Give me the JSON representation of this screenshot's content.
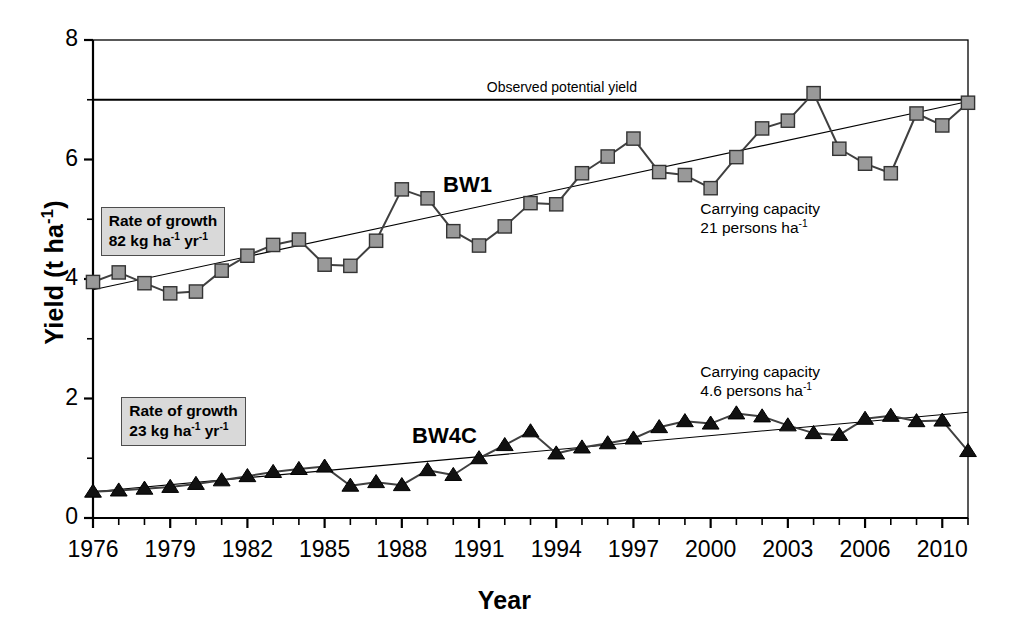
{
  "chart_data": {
    "type": "line",
    "title": "",
    "xlabel": "Year",
    "ylabel": "Yield (t ha-1)",
    "ylabel_base": "Yield (t ha",
    "ylabel_exp": "-1",
    "ylabel_tail": ")",
    "xlim": [
      1976,
      2010
    ],
    "ylim": [
      0,
      8
    ],
    "ytick_values": [
      0,
      2,
      4,
      6,
      8
    ],
    "ytick_labels": [
      "0",
      "2",
      "4",
      "6",
      "8"
    ],
    "yminor_values": [
      1,
      3,
      5,
      7
    ],
    "xtick_values": [
      1976,
      1977,
      1978,
      1979,
      1980,
      1981,
      1982,
      1983,
      1984,
      1985,
      1986,
      1987,
      1988,
      1989,
      1990,
      1991,
      1992,
      1993,
      1994,
      1995,
      1996,
      1997,
      1998,
      1999,
      2000,
      2001,
      2002,
      2003,
      2004,
      2005,
      2006,
      2007,
      2008,
      2009,
      2010
    ],
    "xtick_labels": [
      "1976",
      "1979",
      "1982",
      "1985",
      "1988",
      "1991",
      "1994",
      "1997",
      "2000",
      "2003",
      "2006",
      "2010"
    ],
    "xtick_label_values": [
      1976,
      1979,
      1982,
      1985,
      1988,
      1991,
      1994,
      1997,
      2000,
      2003,
      2006,
      2009
    ],
    "grid": false,
    "legend_position": "inline-annotations",
    "x": [
      1976,
      1977,
      1978,
      1979,
      1980,
      1981,
      1982,
      1983,
      1984,
      1985,
      1986,
      1987,
      1988,
      1989,
      1990,
      1991,
      1992,
      1993,
      1994,
      1995,
      1996,
      1997,
      1998,
      1999,
      2000,
      2001,
      2002,
      2003,
      2004,
      2005,
      2006,
      2007,
      2008,
      2009,
      2010
    ],
    "series": [
      {
        "name": "BW1",
        "marker": "square",
        "marker_color": "#999999",
        "marker_edge": "#333333",
        "values": [
          3.95,
          4.11,
          3.93,
          3.76,
          3.79,
          4.14,
          4.39,
          4.57,
          4.66,
          4.24,
          4.22,
          4.64,
          5.5,
          5.35,
          4.8,
          4.56,
          4.88,
          5.27,
          5.25,
          5.77,
          6.05,
          6.35,
          5.79,
          5.74,
          5.52,
          6.04,
          6.52,
          6.65,
          7.11,
          6.18,
          5.93,
          5.77,
          6.77,
          6.57,
          6.95
        ]
      },
      {
        "name": "BW4C",
        "marker": "triangle",
        "marker_color": "#111111",
        "marker_edge": "#000000",
        "values": [
          0.44,
          0.46,
          0.49,
          0.52,
          0.57,
          0.63,
          0.7,
          0.77,
          0.82,
          0.86,
          0.54,
          0.6,
          0.55,
          0.8,
          0.72,
          1.0,
          1.22,
          1.45,
          1.08,
          1.18,
          1.25,
          1.33,
          1.52,
          1.62,
          1.58,
          1.75,
          1.7,
          1.55,
          1.42,
          1.39,
          1.66,
          1.71,
          1.62,
          1.63,
          1.12
        ]
      }
    ],
    "trendlines": [
      {
        "name": "BW1 trend",
        "slope_t_per_yr": 0.082,
        "x0": 1976,
        "y0": 3.82,
        "x1": 2010,
        "y1": 6.97
      },
      {
        "name": "BW4C trend",
        "slope_t_per_yr": 0.023,
        "x0": 1976,
        "y0": 0.44,
        "x1": 2010,
        "y1": 1.77
      }
    ],
    "reference_lines": [
      {
        "name": "observed-potential-yield",
        "value": 7.0,
        "label": "Observed potential yield"
      }
    ],
    "annotations": [
      {
        "name": "rate-of-growth-bw1",
        "line1": "Rate of growth",
        "line2_num": "82",
        "line2_unit_a": "kg ha",
        "line2_exp_a": "-1",
        "line2_unit_b": "yr",
        "line2_exp_b": "-1"
      },
      {
        "name": "rate-of-growth-bw4c",
        "line1": "Rate of growth",
        "line2_num": "23",
        "line2_unit_a": "kg ha",
        "line2_exp_a": "-1",
        "line2_unit_b": "yr",
        "line2_exp_b": "-1"
      },
      {
        "name": "carrying-capacity-bw1",
        "line1": "Carrying capacity",
        "line2_value": "21",
        "line2_text": "persons ha",
        "line2_exp": "-1"
      },
      {
        "name": "carrying-capacity-bw4c",
        "line1": "Carrying capacity",
        "line2_value": "4.6",
        "line2_text": "persons ha",
        "line2_exp": "-1"
      }
    ],
    "series_labels": [
      {
        "name": "bw1-label",
        "text": "BW1"
      },
      {
        "name": "bw4c-label",
        "text": "BW4C"
      }
    ],
    "colors": {
      "axis": "#000000",
      "bw1_marker_fill": "#999999",
      "bw1_marker_stroke": "#333333",
      "bw4c_marker_fill": "#111111",
      "line": "#404040",
      "trend": "#000000",
      "box_fill": "#d9d9d9",
      "box_border": "#4d4d4d"
    }
  }
}
